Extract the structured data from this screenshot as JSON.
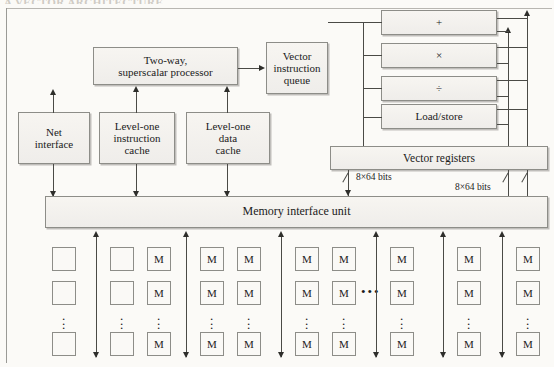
{
  "figure": {
    "running_header": "A VECTOR ARCHITECTURE",
    "type": "block-diagram",
    "colors": {
      "page_background": "#fbfaf7",
      "box_border": "#8d8d88",
      "box_fill": "#f4f2ee",
      "line": "#4a4a46",
      "text": "#1b1b1b"
    }
  },
  "blocks": {
    "net_interface": "Net\ninterface",
    "net_interface_l1": "Net",
    "net_interface_l2": "interface",
    "l1_instruction_cache_l1": "Level-one",
    "l1_instruction_cache_l2": "instruction",
    "l1_instruction_cache_l3": "cache",
    "l1_data_cache_l1": "Level-one",
    "l1_data_cache_l2": "data",
    "l1_data_cache_l3": "cache",
    "processor_l1": "Two-way,",
    "processor_l2": "superscalar processor",
    "vector_queue_l1": "Vector",
    "vector_queue_l2": "instruction",
    "vector_queue_l3": "queue",
    "add_unit": "+",
    "multiply_unit": "×",
    "divide_unit": "÷",
    "load_store_unit": "Load/store",
    "vector_registers": "Vector registers",
    "memory_interface_unit": "Memory interface unit"
  },
  "bus_labels": {
    "left_width": "8×64 bits",
    "right_width": "8×64 bits"
  },
  "memory": {
    "cell_label": "M",
    "vertical_ellipsis": "⋮",
    "horizontal_ellipsis": "•••",
    "columns": [
      {
        "id": "col-1",
        "x": 52,
        "labels": [
          "",
          "",
          ""
        ]
      },
      {
        "id": "col-2",
        "x": 110,
        "labels": [
          "",
          "",
          ""
        ]
      },
      {
        "id": "col-3",
        "x": 147,
        "labels": [
          "M",
          "M",
          "M"
        ]
      },
      {
        "id": "col-4",
        "x": 200,
        "labels": [
          "M",
          "M",
          "M"
        ]
      },
      {
        "id": "col-5",
        "x": 237,
        "labels": [
          "M",
          "M",
          "M"
        ]
      },
      {
        "id": "col-6",
        "x": 295,
        "labels": [
          "M",
          "M",
          "M"
        ]
      },
      {
        "id": "col-7",
        "x": 332,
        "labels": [
          "M",
          "M",
          "M"
        ]
      },
      {
        "id": "col-8",
        "x": 390,
        "labels": [
          "M",
          "M",
          "M"
        ]
      },
      {
        "id": "col-9",
        "x": 457,
        "labels": [
          "M",
          "M",
          "M"
        ]
      },
      {
        "id": "col-10",
        "x": 516,
        "labels": [
          "M",
          "M",
          "M"
        ]
      }
    ]
  }
}
